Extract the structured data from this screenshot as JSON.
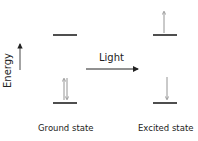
{
  "diagram": {
    "axis_label": "Energy",
    "transition_label": "Light",
    "states": [
      {
        "name": "Ground state",
        "lower_level_electrons": [
          "up",
          "down"
        ],
        "upper_level_electrons": []
      },
      {
        "name": "Excited state",
        "lower_level_electrons": [
          "down"
        ],
        "upper_level_electrons": [
          "up"
        ]
      }
    ],
    "colors": {
      "level_line": "#222222",
      "electron_arrow": "#888888",
      "text": "#222222"
    }
  }
}
